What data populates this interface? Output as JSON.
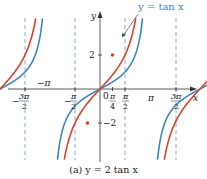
{
  "caption": "(a) y = 2 tan x",
  "chart_data": {
    "type": "line",
    "title": "(a) y = 2 tan x",
    "xlabel": "x",
    "ylabel": "y",
    "x_ticks": [
      "-3π/2",
      "-π",
      "-π/2",
      "0",
      "π/4",
      "π/2",
      "π",
      "3π/2"
    ],
    "y_ticks": [
      "2",
      "-2"
    ],
    "asymptotes": [
      "-3π/2",
      "-π/2",
      "π/2",
      "3π/2"
    ],
    "series": [
      {
        "name": "y = tan x",
        "color": "#3a86c8",
        "function": "tan(x)"
      },
      {
        "name": "y = 2 tan x",
        "color": "#d8432a",
        "function": "2*tan(x)"
      }
    ],
    "annotations": [
      {
        "text": "y = tan x",
        "points_to": "blue curve"
      },
      {
        "text": "point (π/4, 2)",
        "marker": "red dot"
      },
      {
        "text": "point (-π/4, -2)",
        "marker": "red dot"
      }
    ],
    "xlim": [
      -4.9,
      5.1
    ],
    "ylim": [
      -5.8,
      5.2
    ],
    "grid": false,
    "legend": "annotation"
  },
  "labels": {
    "y_axis": "y",
    "x_axis": "x",
    "tan_label": "y = tan x",
    "y2": "2",
    "yneg2": "−2",
    "zero": "0",
    "neg_pi": "−π",
    "pi": "π"
  },
  "colors": {
    "blue": "#3a86c8",
    "red": "#d8432a",
    "asymptote": "#6aa8d8",
    "axis": "#333333"
  }
}
